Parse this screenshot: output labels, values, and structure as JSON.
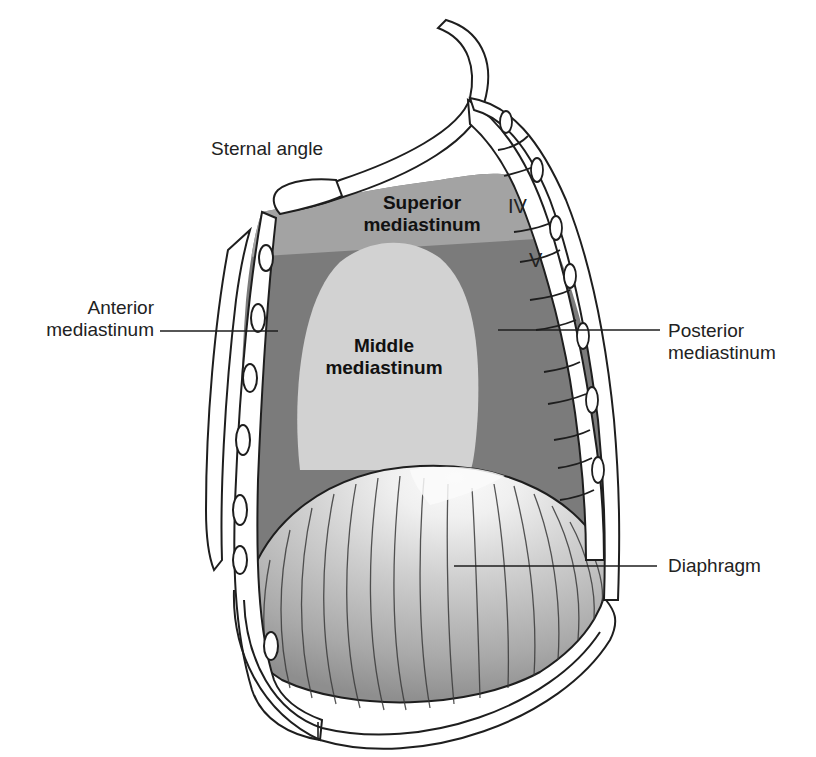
{
  "figure": {
    "labels": {
      "sternal_angle": "Sternal angle",
      "superior_mediastinum_line1": "Superior",
      "superior_mediastinum_line2": "mediastinum",
      "anterior_mediastinum_line1": "Anterior",
      "anterior_mediastinum_line2": "mediastinum",
      "middle_mediastinum_line1": "Middle",
      "middle_mediastinum_line2": "mediastinum",
      "posterior_mediastinum_line1": "Posterior",
      "posterior_mediastinum_line2": "mediastinum",
      "diaphragm": "Diaphragm",
      "vertebra_iv": "IV",
      "vertebra_v": "V"
    },
    "colors": {
      "background": "#ffffff",
      "superior_region": "#a3a3a3",
      "anterior_posterior_region": "#7b7b7b",
      "middle_region": "#d2d2d2",
      "diaphragm_light": "#f4f4f4",
      "diaphragm_dark": "#8e8e8e",
      "outline": "#1e1e1e",
      "bone": "#ffffff"
    }
  }
}
